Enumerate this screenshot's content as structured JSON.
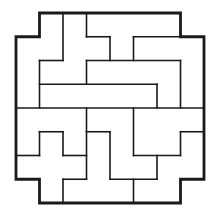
{
  "diagram": {
    "type": "pentomino-style tiling puzzle",
    "grid": {
      "cols": 8,
      "rows": 8,
      "origin_x": 16,
      "origin_y": 13,
      "cell_w": 23.5,
      "cell_h": 23.75
    },
    "colors": {
      "line": "#1a1a1a",
      "background": "#ffffff"
    },
    "outline": [
      [
        1,
        0
      ],
      [
        7,
        0
      ],
      [
        7,
        1
      ],
      [
        8,
        1
      ],
      [
        8,
        7
      ],
      [
        7,
        7
      ],
      [
        7,
        8
      ],
      [
        1,
        8
      ],
      [
        1,
        7
      ],
      [
        0,
        7
      ],
      [
        0,
        1
      ],
      [
        1,
        1
      ]
    ],
    "inner_segments": [
      [
        [
          2,
          0
        ],
        [
          2,
          2
        ]
      ],
      [
        [
          1,
          2
        ],
        [
          2,
          2
        ]
      ],
      [
        [
          1,
          2
        ],
        [
          1,
          4
        ]
      ],
      [
        [
          3,
          0
        ],
        [
          3,
          1
        ]
      ],
      [
        [
          3,
          1
        ],
        [
          4,
          1
        ]
      ],
      [
        [
          4,
          1
        ],
        [
          4,
          2
        ]
      ],
      [
        [
          5,
          1
        ],
        [
          5,
          2
        ]
      ],
      [
        [
          5,
          1
        ],
        [
          7,
          1
        ]
      ],
      [
        [
          3,
          2
        ],
        [
          7,
          2
        ]
      ],
      [
        [
          3,
          2
        ],
        [
          3,
          3
        ]
      ],
      [
        [
          7,
          2
        ],
        [
          7,
          4
        ]
      ],
      [
        [
          1,
          3
        ],
        [
          6,
          3
        ]
      ],
      [
        [
          6,
          3
        ],
        [
          6,
          4
        ]
      ],
      [
        [
          0,
          4
        ],
        [
          8,
          4
        ]
      ],
      [
        [
          1,
          5
        ],
        [
          2,
          5
        ]
      ],
      [
        [
          1,
          5
        ],
        [
          1,
          6
        ]
      ],
      [
        [
          2,
          5
        ],
        [
          2,
          6
        ]
      ],
      [
        [
          0,
          6
        ],
        [
          1,
          6
        ]
      ],
      [
        [
          2,
          6
        ],
        [
          3,
          6
        ]
      ],
      [
        [
          2,
          7
        ],
        [
          3,
          7
        ]
      ],
      [
        [
          2,
          7
        ],
        [
          2,
          8
        ]
      ],
      [
        [
          3,
          4
        ],
        [
          3,
          7
        ]
      ],
      [
        [
          3,
          5
        ],
        [
          4,
          5
        ]
      ],
      [
        [
          4,
          5
        ],
        [
          4,
          7
        ]
      ],
      [
        [
          4,
          7
        ],
        [
          6,
          7
        ]
      ],
      [
        [
          5,
          4
        ],
        [
          5,
          6
        ]
      ],
      [
        [
          5,
          6
        ],
        [
          7,
          6
        ]
      ],
      [
        [
          6,
          6
        ],
        [
          6,
          7
        ]
      ],
      [
        [
          5,
          7
        ],
        [
          5,
          8
        ]
      ],
      [
        [
          7,
          5
        ],
        [
          8,
          5
        ]
      ],
      [
        [
          7,
          5
        ],
        [
          7,
          6
        ]
      ]
    ]
  }
}
